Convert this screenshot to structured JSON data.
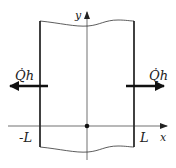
{
  "diagram": {
    "axes": {
      "x_label": "x",
      "y_label": "y"
    },
    "bounds": {
      "left_label": "-L",
      "right_label": "L"
    },
    "heat_flux": {
      "left_label": "Q̇h",
      "right_label": "Q̇h",
      "left_direction": "left",
      "right_direction": "right"
    },
    "origin_marker": "dot",
    "colors": {
      "line": "#222222",
      "arrow": "#111111",
      "background": "#ffffff"
    }
  }
}
